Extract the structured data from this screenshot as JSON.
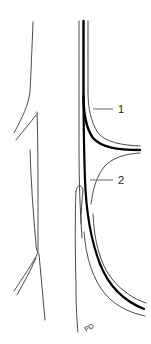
{
  "figure": {
    "kind": "anatomical-line-drawing",
    "background_color": "#ffffff",
    "ink_color": "#1a1a1a",
    "thin_stroke_color": "#4a4a4a",
    "thick_stroke_color": "#000000",
    "leader_line_color": "#555555",
    "width": 151,
    "height": 344
  },
  "panels": {
    "left": {
      "name": "left-vessel-outline",
      "description": "thin outline of a branching vessel, two side branches on the left"
    },
    "right": {
      "name": "right-vessel-outline",
      "description": "vessel with thick emphasized wall, branches to the right and lower right"
    }
  },
  "labels": [
    {
      "id": "label-1",
      "text": "1",
      "x": 118,
      "y": 113,
      "leader_from_x": 113,
      "leader_from_y": 109,
      "leader_to_x": 93,
      "leader_to_y": 109
    },
    {
      "id": "label-2",
      "text": "2",
      "x": 118,
      "y": 184,
      "leader_from_x": 113,
      "leader_from_y": 180,
      "leader_to_x": 90,
      "leader_to_y": 180
    }
  ],
  "annotation_mark": {
    "id": "bottom-handwritten-mark",
    "text": "PD",
    "x": 86,
    "y": 332
  }
}
